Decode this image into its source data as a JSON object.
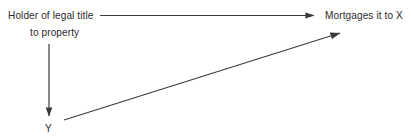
{
  "diagram": {
    "background_color": "#ffffff",
    "stroke_color": "#3a3a3a",
    "text_color": "#2b2b2b",
    "width": 411,
    "height": 138,
    "nodes": [
      {
        "id": "holder",
        "line1": "Holder of legal title",
        "line2": "to property",
        "x": 8,
        "y": 9
      },
      {
        "id": "mortgages",
        "label": "Mortgages it to X",
        "x": 325,
        "y": 9
      },
      {
        "id": "y-node",
        "label": "Y",
        "x": 45,
        "y": 122
      }
    ],
    "arrows": [
      {
        "id": "holder-to-mortgages",
        "name": "horizontal-arrow",
        "from": [
          100,
          15
        ],
        "to": [
          316,
          15
        ],
        "direction": "right"
      },
      {
        "id": "holder-to-y",
        "name": "vertical-arrow",
        "from": [
          49,
          44
        ],
        "to": [
          49,
          119
        ],
        "direction": "down"
      },
      {
        "id": "y-to-mortgages",
        "name": "diagonal-arrow",
        "from": [
          64,
          120
        ],
        "to": [
          343,
          32
        ],
        "direction": "up-right"
      }
    ]
  }
}
